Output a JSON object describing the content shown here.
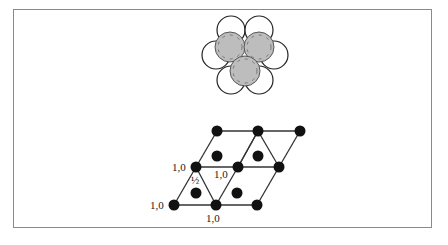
{
  "figure": {
    "top_cluster": {
      "description": "close-packed spheres: hexagonal ring of six white spheres with three gray spheres nested above",
      "white_spheres": [
        {
          "cx": 231,
          "cy": 30
        },
        {
          "cx": 259,
          "cy": 30
        },
        {
          "cx": 216,
          "cy": 55
        },
        {
          "cx": 274,
          "cy": 55
        },
        {
          "cx": 231,
          "cy": 80
        },
        {
          "cx": 259,
          "cy": 80
        }
      ],
      "gray_spheres": [
        {
          "cx": 230,
          "cy": 47
        },
        {
          "cx": 259,
          "cy": 47
        },
        {
          "cx": 245,
          "cy": 71
        }
      ],
      "white_radius": 14,
      "gray_radius": 15,
      "gray_color": "#bdbdbd"
    },
    "lattice": {
      "nodes": [
        {
          "x": 217,
          "y": 131
        },
        {
          "x": 258,
          "y": 131
        },
        {
          "x": 300,
          "y": 131
        },
        {
          "x": 196,
          "y": 167
        },
        {
          "x": 238,
          "y": 167
        },
        {
          "x": 279,
          "y": 167
        },
        {
          "x": 174,
          "y": 205
        },
        {
          "x": 216,
          "y": 205
        },
        {
          "x": 257,
          "y": 205
        }
      ],
      "interior_dots": [
        {
          "x": 217,
          "y": 156
        },
        {
          "x": 258,
          "y": 156
        },
        {
          "x": 196,
          "y": 193
        },
        {
          "x": 237,
          "y": 193
        }
      ],
      "labels": [
        {
          "text": "1,0",
          "x": 150,
          "y": 209,
          "name": "label-bottom-left"
        },
        {
          "text": "1,0",
          "x": 206,
          "y": 222,
          "name": "label-bottom-middle"
        },
        {
          "text": "1,0",
          "x": 172,
          "y": 171,
          "name": "label-middle-left"
        },
        {
          "text": "1,0",
          "x": 214,
          "y": 178,
          "name": "label-middle-center"
        },
        {
          "text": "½",
          "x": 191,
          "y": 184,
          "name": "label-half"
        }
      ]
    }
  }
}
